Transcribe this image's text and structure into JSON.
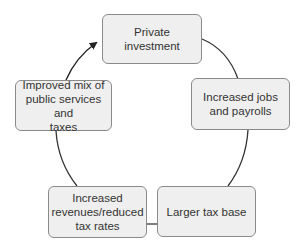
{
  "diagram": {
    "type": "cycle",
    "nodes": [
      {
        "id": "private",
        "label": "Private\ninvestment"
      },
      {
        "id": "jobs",
        "label": "Increased jobs\nand payrolls"
      },
      {
        "id": "taxbase",
        "label": "Larger tax base"
      },
      {
        "id": "revenues",
        "label": "Increased\nrevenues/reduced\ntax rates"
      },
      {
        "id": "improved",
        "label": "Improved mix of\npublic services and\ntaxes"
      }
    ],
    "edges": [
      {
        "from": "private",
        "to": "jobs"
      },
      {
        "from": "jobs",
        "to": "taxbase"
      },
      {
        "from": "taxbase",
        "to": "revenues"
      },
      {
        "from": "revenues",
        "to": "improved"
      },
      {
        "from": "improved",
        "to": "private",
        "arrow": true
      }
    ],
    "colors": {
      "box_fill": "#efefef",
      "box_border": "#8a8a8a",
      "line": "#222222"
    }
  }
}
